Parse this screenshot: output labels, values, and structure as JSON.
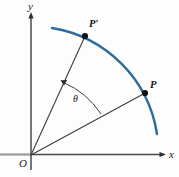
{
  "figure": {
    "type": "geometry-diagram",
    "background_color": "#fdfdfd",
    "axes": {
      "x_label": "x",
      "y_label": "y",
      "origin_label": "O",
      "axis_color": "#4a4a4a",
      "origin": {
        "x": 31,
        "y": 155
      },
      "x_axis_end": {
        "x": 166,
        "y": 155
      },
      "y_axis_end": {
        "x": 31,
        "y": 14
      }
    },
    "arc": {
      "name": "blue-arc",
      "color": "#2e6d9e",
      "stroke_width": 2.4,
      "start": {
        "x": 52,
        "y": 28
      },
      "end": {
        "x": 157,
        "y": 134
      }
    },
    "points": [
      {
        "id": "P-prime",
        "label": "P′",
        "x": 85,
        "y": 36,
        "label_x": 89,
        "label_y": 27
      },
      {
        "id": "P",
        "label": "P",
        "x": 145,
        "y": 93,
        "label_x": 150,
        "label_y": 88
      }
    ],
    "rays": [
      {
        "id": "ray-to-P-prime",
        "from": {
          "x": 31,
          "y": 155
        },
        "to": {
          "x": 85,
          "y": 36
        },
        "color": "#3d3d3d"
      },
      {
        "id": "ray-to-P",
        "from": {
          "x": 31,
          "y": 155
        },
        "to": {
          "x": 145,
          "y": 93
        },
        "color": "#3d3d3d"
      }
    ],
    "angle": {
      "label": "θ",
      "label_x": 73,
      "label_y": 102,
      "arc_start": {
        "x": 101,
        "y": 114
      },
      "arc_end": {
        "x": 62,
        "y": 81
      },
      "arrow_at": "arc_end",
      "color": "#3d3d3d"
    }
  }
}
